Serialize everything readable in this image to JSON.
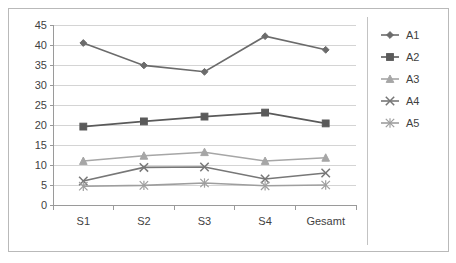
{
  "chart_data": {
    "type": "line",
    "title": "",
    "subtitle": "",
    "xlabel": "",
    "ylabel": "",
    "categories": [
      "S1",
      "S2",
      "S3",
      "S4",
      "Gesamt"
    ],
    "ylim": [
      0,
      45
    ],
    "ytick_labels": [
      "0",
      "5",
      "10",
      "15",
      "20",
      "25",
      "30",
      "35",
      "40",
      "45"
    ],
    "ytick_values": [
      0,
      5,
      10,
      15,
      20,
      25,
      30,
      35,
      40,
      45
    ],
    "grid": true,
    "legend_position": "right",
    "series": [
      {
        "name": "A1",
        "marker": "diamond",
        "color": "#6b6b6b",
        "values": [
          40.5,
          34.9,
          33.3,
          42.2,
          38.8
        ]
      },
      {
        "name": "A2",
        "marker": "square",
        "color": "#5a5a5a",
        "values": [
          19.6,
          20.9,
          22.1,
          23.1,
          20.4
        ]
      },
      {
        "name": "A3",
        "marker": "triangle",
        "color": "#a6a6a6",
        "values": [
          11.0,
          12.3,
          13.2,
          11.0,
          11.8
        ]
      },
      {
        "name": "A4",
        "marker": "x",
        "color": "#777777",
        "values": [
          6.0,
          9.4,
          9.5,
          6.5,
          8.0
        ]
      },
      {
        "name": "A5",
        "marker": "asterisk",
        "color": "#9e9e9e",
        "values": [
          4.7,
          4.9,
          5.5,
          4.8,
          5.0
        ]
      }
    ]
  },
  "colors": {
    "frame_border": "#b9b9b9",
    "gridline": "#d4d4d4",
    "axis": "#9a9a9a",
    "text": "#3f3f3f",
    "background": "#ffffff"
  }
}
